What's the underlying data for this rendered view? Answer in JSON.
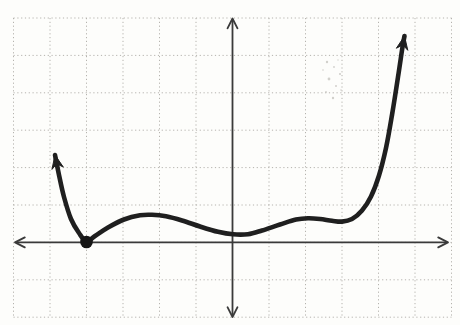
{
  "figure": {
    "width": 460,
    "height": 325,
    "background": "#fdfdfb",
    "colors": {
      "grid": "#b5b3ae",
      "axis": "#3a3a3a",
      "curve": "#1f1f1f",
      "point": "#161616",
      "smudge": "#c3c1bc"
    }
  },
  "chart_data": {
    "type": "line",
    "title": "",
    "xlabel": "",
    "ylabel": "",
    "legend": null,
    "grid": "dotted 1-unit squares",
    "axis_tick_labels": "none",
    "x_range": [
      -6,
      6.2
    ],
    "y_range": [
      -2.2,
      6.1
    ],
    "series": [
      {
        "name": "f(x)",
        "style": "thick hand-drawn stroke with arrowheads at both ends",
        "points": [
          [
            -4.84,
            2.31
          ],
          [
            -4.67,
            1.72
          ],
          [
            -4.45,
            1.0
          ],
          [
            -4.21,
            0.39
          ],
          [
            -4.0,
            0.02
          ],
          [
            -3.77,
            0.17
          ],
          [
            -3.41,
            0.39
          ],
          [
            -2.95,
            0.61
          ],
          [
            -2.53,
            0.72
          ],
          [
            -2.21,
            0.74
          ],
          [
            -1.82,
            0.69
          ],
          [
            -1.38,
            0.57
          ],
          [
            -0.89,
            0.41
          ],
          [
            -0.4,
            0.28
          ],
          [
            0.01,
            0.21
          ],
          [
            0.42,
            0.22
          ],
          [
            0.81,
            0.33
          ],
          [
            1.3,
            0.49
          ],
          [
            1.74,
            0.61
          ],
          [
            2.07,
            0.65
          ],
          [
            2.4,
            0.63
          ],
          [
            2.73,
            0.57
          ],
          [
            3.0,
            0.55
          ],
          [
            3.27,
            0.63
          ],
          [
            3.55,
            0.84
          ],
          [
            3.79,
            1.21
          ],
          [
            4.01,
            1.78
          ],
          [
            4.21,
            2.52
          ],
          [
            4.37,
            3.41
          ],
          [
            4.53,
            4.4
          ],
          [
            4.67,
            5.28
          ],
          [
            4.73,
            5.52
          ]
        ]
      }
    ],
    "marked_points": [
      {
        "x": -4,
        "y": 0,
        "style": "solid filled dot",
        "meaning": "curve touches (is tangent to) the x-axis"
      }
    ],
    "features": {
      "tangent_root_x": -4,
      "local_max_1": [
        -2.2,
        0.74
      ],
      "local_min_1": [
        0.0,
        0.21
      ],
      "local_max_2": [
        2.05,
        0.65
      ],
      "local_min_2": [
        3.0,
        0.55
      ],
      "end_behavior": "both ends rise toward +infinity (up arrows)"
    }
  },
  "render_geometry": {
    "grid": {
      "x_start": 13.5,
      "x_step": 36.5,
      "x_lines": 13,
      "y_start": 18,
      "y_step": 37.4,
      "y_lines": 9
    },
    "origin_px": [
      232.5,
      242.4
    ],
    "unit_px": [
      36.5,
      37.4
    ],
    "x_axis": {
      "y": 242.4,
      "x1": 15,
      "x2": 448
    },
    "y_axis": {
      "x": 232.5,
      "y1": 18.5,
      "y2": 317
    },
    "axis_stroke_width": 1.8,
    "axis_arrow": {
      "length": 11,
      "half_angle_deg": 27
    },
    "axis_arrows": [
      {
        "name": "x-axis-left-arrow",
        "tip": [
          15,
          242.4
        ],
        "dir": [
          -1,
          0
        ]
      },
      {
        "name": "x-axis-right-arrow",
        "tip": [
          448,
          242.4
        ],
        "dir": [
          1,
          0
        ]
      },
      {
        "name": "y-axis-top-arrow",
        "tip": [
          232.5,
          18.5
        ],
        "dir": [
          0,
          -1
        ]
      },
      {
        "name": "y-axis-bottom-arrow",
        "tip": [
          232.5,
          317
        ],
        "dir": [
          0,
          1
        ]
      }
    ],
    "curve_px": [
      [
        55,
        155
      ],
      [
        59,
        175
      ],
      [
        64,
        197
      ],
      [
        71,
        219
      ],
      [
        79,
        233
      ],
      [
        86.5,
        241.5
      ],
      [
        95,
        236
      ],
      [
        108,
        227.5
      ],
      [
        124,
        219.5
      ],
      [
        140,
        215.3
      ],
      [
        152,
        214.8
      ],
      [
        166,
        216.3
      ],
      [
        182,
        220.5
      ],
      [
        200,
        226.5
      ],
      [
        218,
        231.8
      ],
      [
        233,
        234.3
      ],
      [
        248,
        234.2
      ],
      [
        262,
        230.5
      ],
      [
        280,
        224.5
      ],
      [
        296,
        219.6
      ],
      [
        308,
        218.3
      ],
      [
        320,
        219
      ],
      [
        332,
        220.8
      ],
      [
        342,
        221.6
      ],
      [
        352,
        219
      ],
      [
        362,
        210.5
      ],
      [
        371,
        196.5
      ],
      [
        379,
        175.5
      ],
      [
        386,
        148
      ],
      [
        392,
        115
      ],
      [
        398,
        77
      ],
      [
        402.5,
        47
      ],
      [
        404.5,
        36
      ]
    ],
    "curve_stroke_width": 4.6,
    "curve_arrow": {
      "length": 13.5,
      "half_width": 5.8,
      "back": 9
    },
    "point_px": {
      "cx": 86.5,
      "cy": 242,
      "r": 6.3
    },
    "smudge_dots": [
      [
        327,
        62,
        1.2
      ],
      [
        334,
        67,
        0.9
      ],
      [
        340,
        74,
        1.1
      ],
      [
        329,
        79,
        1.4
      ],
      [
        336,
        86,
        1.0
      ],
      [
        326,
        92,
        0.9
      ],
      [
        333,
        98,
        1.2
      ],
      [
        341,
        90,
        0.8
      ],
      [
        323,
        70,
        0.8
      ],
      [
        338,
        60,
        0.7
      ]
    ]
  }
}
